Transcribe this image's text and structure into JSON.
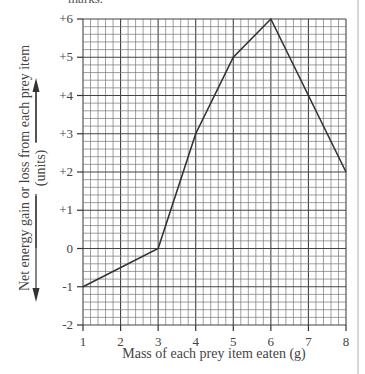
{
  "page": {
    "cut_text": "marks."
  },
  "chart_data": {
    "type": "line",
    "title": "",
    "xlabel": "Mass of each prey item eaten (g)",
    "ylabel": "Net energy gain or loss from each prey item",
    "ylabel_units": "(units)",
    "x": [
      1,
      3,
      4,
      5,
      6,
      7,
      8
    ],
    "series": [
      {
        "name": "Net energy gain or loss",
        "values": [
          -1,
          0,
          3,
          5,
          6,
          4,
          2
        ]
      }
    ],
    "xlim": [
      1,
      8
    ],
    "ylim": [
      -2,
      6
    ],
    "x_ticks": [
      "1",
      "2",
      "3",
      "4",
      "5",
      "6",
      "7",
      "8"
    ],
    "y_ticks": [
      "+6",
      "+5",
      "+4",
      "+3",
      "+2",
      "+1",
      "0",
      "-1",
      "-2"
    ],
    "grid": true,
    "minor_divisions": 5,
    "legend": "none",
    "line_color": "#333333"
  }
}
